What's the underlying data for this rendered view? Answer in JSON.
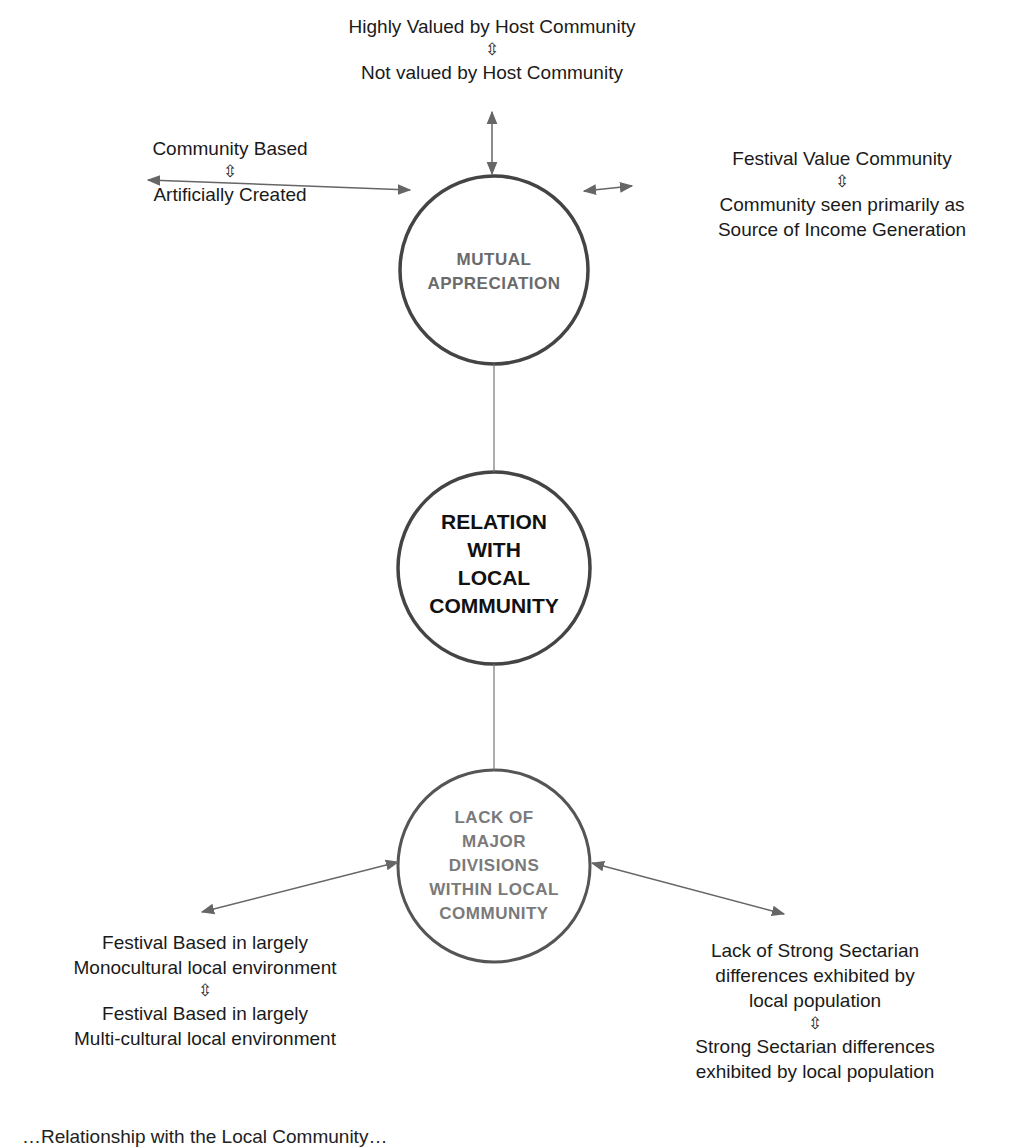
{
  "diagram": {
    "nodes": {
      "top": {
        "lines": [
          "MUTUAL",
          "APPRECIATION"
        ]
      },
      "middle": {
        "lines": [
          "RELATION",
          "WITH",
          "LOCAL",
          "COMMUNITY"
        ]
      },
      "bottom": {
        "lines": [
          "LACK OF",
          "MAJOR",
          "DIVISIONS",
          "WITHIN LOCAL",
          "COMMUNITY"
        ]
      }
    },
    "dimensions": {
      "top_center": {
        "upper": "Highly Valued by Host Community",
        "symbol": "⇳",
        "lower": "Not valued by Host Community"
      },
      "top_left": {
        "upper": "Community Based",
        "symbol": "⇳",
        "lower": "Artificially Created"
      },
      "top_right": {
        "upper": "Festival Value Community",
        "symbol": "⇳",
        "lower_1": "Community seen primarily as",
        "lower_2": "Source of Income Generation"
      },
      "bottom_left": {
        "upper_1": "Festival Based in largely",
        "upper_2": "Monocultural local environment",
        "symbol": "⇳",
        "lower_1": "Festival Based in largely",
        "lower_2": "Multi-cultural local environment"
      },
      "bottom_right": {
        "upper_1": "Lack of  Strong Sectarian",
        "upper_2": "differences exhibited by",
        "upper_3": "local population",
        "symbol": "⇳",
        "lower_1": "Strong Sectarian differences",
        "lower_2": "exhibited by local population"
      }
    },
    "caption": "…Relationship with the Local Community…",
    "colors": {
      "circle_stroke": "#444444",
      "arrow": "#666666",
      "connector": "#777777"
    }
  }
}
